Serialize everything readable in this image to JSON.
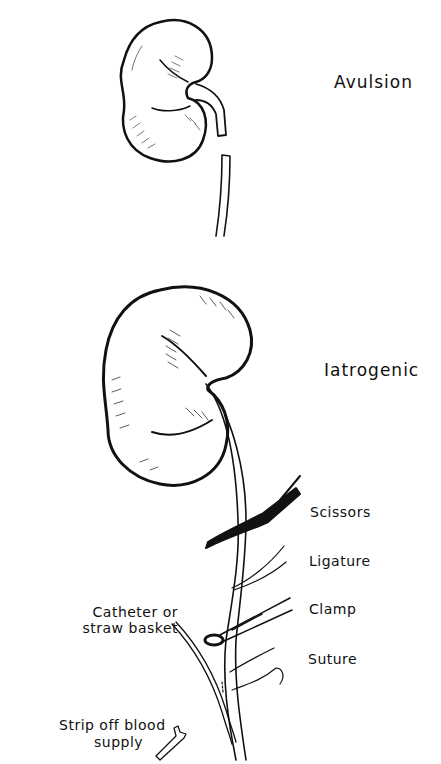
{
  "figure": {
    "panels": [
      {
        "id": "avulsion",
        "title": "Avulsion"
      },
      {
        "id": "iatrogenic",
        "title": "Iatrogenic"
      }
    ],
    "instrument_labels": {
      "scissors": "Scissors",
      "ligature": "Ligature",
      "clamp": "Clamp",
      "suture": "Suture"
    },
    "left_labels": {
      "catheter_line1": "Catheter or",
      "catheter_line2": "straw basket",
      "strip_line1": "Strip off blood",
      "strip_line2": "supply"
    },
    "colors": {
      "ink": "#111111",
      "background": "#ffffff"
    }
  }
}
